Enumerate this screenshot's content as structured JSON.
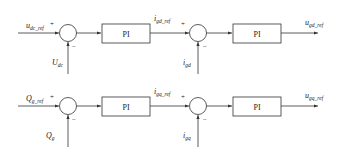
{
  "colors": {
    "stroke": "#333333",
    "text": "#222222",
    "background": "#ffffff"
  },
  "rows": [
    {
      "input": {
        "main": "u",
        "sub": "dc_ref"
      },
      "feedback1": {
        "main": "U",
        "sub": "dc"
      },
      "controller1": "PI",
      "intermediate": {
        "main": "i",
        "sub": "gd_ref"
      },
      "feedback2": {
        "main": "i",
        "sub": "gd"
      },
      "controller2": "PI",
      "output": {
        "main": "u",
        "sub": "gd_ref"
      },
      "plus_sign": "+",
      "minus_sign": "−"
    },
    {
      "input": {
        "main": "Q",
        "sub": "g_ref"
      },
      "feedback1": {
        "main": "Q",
        "sub": "g"
      },
      "controller1": "PI",
      "intermediate": {
        "main": "i",
        "sub": "gq_ref"
      },
      "feedback2": {
        "main": "i",
        "sub": "gq"
      },
      "controller2": "PI",
      "output": {
        "main": "u",
        "sub": "gq_ref"
      },
      "plus_sign": "+",
      "minus_sign": "−"
    }
  ]
}
